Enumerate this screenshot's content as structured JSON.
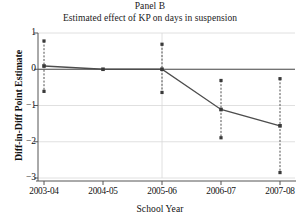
{
  "chart_data": {
    "type": "line",
    "title": "Panel B",
    "subtitle": "Estimated effect of KP on days in suspension",
    "xlabel": "School Year",
    "ylabel": "Diff-in-Diff Point Estimate",
    "categories": [
      "2003-04",
      "2004-05",
      "2005-06",
      "2006-07",
      "2007-08"
    ],
    "values": [
      0.09,
      0.0,
      0.0,
      -1.11,
      -1.56
    ],
    "ci_upper": [
      0.78,
      0.0,
      0.69,
      -0.31,
      -0.26
    ],
    "ci_lower": [
      -0.61,
      0.0,
      -0.64,
      -1.89,
      -2.85
    ],
    "ylim": [
      -3,
      1
    ],
    "yticks": [
      "1",
      "0",
      "−1",
      "−2",
      "−3"
    ],
    "ytick_values": [
      1,
      0,
      -1,
      -2,
      -3
    ],
    "grid": true,
    "legend": "none",
    "series_name": "Diff-in-Diff Point Estimate",
    "line_color": "#4d4d4d",
    "marker_color": "#3a3a3a",
    "errorbar_style": "dashed",
    "grid_color": "#d8d8d8"
  }
}
